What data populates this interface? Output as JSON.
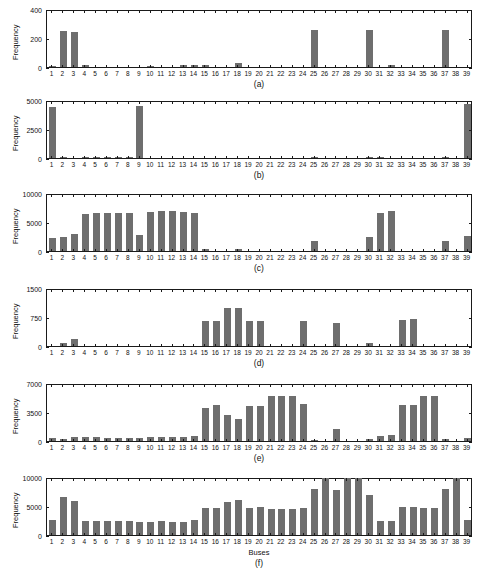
{
  "figure": {
    "background": "#ffffff",
    "bar_color": "#6e6e6e",
    "axis_color": "#1a1a1a",
    "xlabel": "Buses",
    "ylabel": "Frequency"
  },
  "chart_data": [
    {
      "type": "bar",
      "panel": "(a)",
      "title": "",
      "xlabel": "",
      "ylabel": "Frequency",
      "ylim": [
        0,
        400
      ],
      "yticks": [
        0,
        200,
        400
      ],
      "ytick_labels": [
        "0",
        "200",
        "400"
      ],
      "grid": false,
      "legend": "none",
      "categories": [
        "1",
        "2",
        "3",
        "4",
        "5",
        "6",
        "7",
        "8",
        "9",
        "10",
        "11",
        "12",
        "13",
        "14",
        "15",
        "16",
        "17",
        "18",
        "19",
        "20",
        "21",
        "22",
        "23",
        "24",
        "25",
        "26",
        "27",
        "28",
        "29",
        "30",
        "31",
        "32",
        "33",
        "34",
        "35",
        "36",
        "37",
        "38",
        "39"
      ],
      "values": [
        5,
        250,
        245,
        14,
        0,
        0,
        0,
        0,
        0,
        9,
        0,
        0,
        12,
        13,
        13,
        0,
        0,
        25,
        0,
        0,
        0,
        0,
        0,
        0,
        258,
        0,
        0,
        0,
        0,
        260,
        0,
        14,
        0,
        0,
        0,
        0,
        262,
        0,
        0
      ]
    },
    {
      "type": "bar",
      "panel": "(b)",
      "title": "",
      "xlabel": "",
      "ylabel": "Frequency",
      "ylim": [
        0,
        5000
      ],
      "yticks": [
        0,
        2500,
        5000
      ],
      "ytick_labels": [
        "0",
        "2500",
        "5000"
      ],
      "grid": false,
      "legend": "none",
      "categories": [
        "1",
        "2",
        "3",
        "4",
        "5",
        "6",
        "7",
        "8",
        "9",
        "10",
        "11",
        "12",
        "13",
        "14",
        "15",
        "16",
        "17",
        "18",
        "19",
        "20",
        "21",
        "22",
        "23",
        "24",
        "25",
        "26",
        "27",
        "28",
        "29",
        "30",
        "31",
        "32",
        "33",
        "34",
        "35",
        "36",
        "37",
        "38",
        "39"
      ],
      "values": [
        4500,
        60,
        0,
        40,
        50,
        40,
        30,
        40,
        4600,
        0,
        0,
        0,
        0,
        0,
        0,
        0,
        0,
        0,
        0,
        0,
        0,
        0,
        0,
        0,
        110,
        0,
        0,
        0,
        0,
        90,
        70,
        0,
        0,
        0,
        0,
        0,
        80,
        0,
        4700
      ]
    },
    {
      "type": "bar",
      "panel": "(c)",
      "title": "",
      "xlabel": "",
      "ylabel": "Frequency",
      "ylim": [
        0,
        10000
      ],
      "yticks": [
        0,
        5000,
        10000
      ],
      "ytick_labels": [
        "0",
        "5000",
        "10000"
      ],
      "grid": false,
      "legend": "none",
      "categories": [
        "1",
        "2",
        "3",
        "4",
        "5",
        "6",
        "7",
        "8",
        "9",
        "10",
        "11",
        "12",
        "13",
        "14",
        "15",
        "16",
        "17",
        "18",
        "19",
        "20",
        "21",
        "22",
        "23",
        "24",
        "25",
        "26",
        "27",
        "28",
        "29",
        "30",
        "31",
        "32",
        "33",
        "34",
        "35",
        "36",
        "37",
        "38",
        "39"
      ],
      "values": [
        2200,
        2400,
        2900,
        6550,
        6600,
        6600,
        6600,
        6600,
        2800,
        6900,
        6950,
        6950,
        6900,
        6600,
        300,
        0,
        0,
        400,
        0,
        0,
        0,
        0,
        0,
        0,
        1700,
        0,
        0,
        0,
        0,
        2500,
        6700,
        7000,
        0,
        0,
        0,
        0,
        1700,
        0,
        2700
      ]
    },
    {
      "type": "bar",
      "panel": "(d)",
      "title": "",
      "xlabel": "",
      "ylabel": "Frequency",
      "ylim": [
        0,
        1500
      ],
      "yticks": [
        0,
        750,
        1500
      ],
      "ytick_labels": [
        "0",
        "750",
        "1500"
      ],
      "grid": false,
      "legend": "none",
      "categories": [
        "1",
        "2",
        "3",
        "4",
        "5",
        "6",
        "7",
        "8",
        "9",
        "10",
        "11",
        "12",
        "13",
        "14",
        "15",
        "16",
        "17",
        "18",
        "19",
        "20",
        "21",
        "22",
        "23",
        "24",
        "25",
        "26",
        "27",
        "28",
        "29",
        "30",
        "31",
        "32",
        "33",
        "34",
        "35",
        "36",
        "37",
        "38",
        "39"
      ],
      "values": [
        0,
        80,
        175,
        0,
        0,
        0,
        0,
        0,
        0,
        0,
        0,
        0,
        0,
        0,
        670,
        670,
        1010,
        1010,
        665,
        665,
        0,
        0,
        0,
        665,
        0,
        0,
        600,
        0,
        0,
        90,
        0,
        0,
        695,
        700,
        0,
        0,
        0,
        0,
        0
      ]
    },
    {
      "type": "bar",
      "panel": "(e)",
      "title": "",
      "xlabel": "",
      "ylabel": "Frequency",
      "ylim": [
        0,
        7000
      ],
      "yticks": [
        0,
        3500,
        7000
      ],
      "ytick_labels": [
        "0",
        "3500",
        "7000"
      ],
      "grid": false,
      "legend": "none",
      "categories": [
        "1",
        "2",
        "3",
        "4",
        "5",
        "6",
        "7",
        "8",
        "9",
        "10",
        "11",
        "12",
        "13",
        "14",
        "15",
        "16",
        "17",
        "18",
        "19",
        "20",
        "21",
        "22",
        "23",
        "24",
        "25",
        "26",
        "27",
        "28",
        "29",
        "30",
        "31",
        "32",
        "33",
        "34",
        "35",
        "36",
        "37",
        "38",
        "39"
      ],
      "values": [
        330,
        200,
        480,
        520,
        450,
        430,
        380,
        330,
        330,
        520,
        520,
        470,
        450,
        600,
        4100,
        4400,
        3200,
        2700,
        4300,
        4300,
        5500,
        5500,
        5500,
        4500,
        180,
        0,
        1500,
        0,
        0,
        250,
        600,
        700,
        4400,
        4400,
        5500,
        5500,
        300,
        0,
        400
      ]
    },
    {
      "type": "bar",
      "panel": "(f)",
      "title": "",
      "xlabel": "Buses",
      "ylabel": "Frequency",
      "ylim": [
        0,
        10000
      ],
      "yticks": [
        0,
        5000,
        10000
      ],
      "ytick_labels": [
        "0",
        "5000",
        "10000"
      ],
      "grid": false,
      "legend": "none",
      "categories": [
        "1",
        "2",
        "3",
        "4",
        "5",
        "6",
        "7",
        "8",
        "9",
        "10",
        "11",
        "12",
        "13",
        "14",
        "15",
        "16",
        "17",
        "18",
        "19",
        "20",
        "21",
        "22",
        "23",
        "24",
        "25",
        "26",
        "27",
        "28",
        "29",
        "30",
        "31",
        "32",
        "33",
        "34",
        "35",
        "36",
        "37",
        "38",
        "39"
      ],
      "values": [
        2700,
        6700,
        6000,
        2400,
        2400,
        2400,
        2450,
        2500,
        2200,
        2350,
        2400,
        2300,
        2300,
        2550,
        4800,
        4800,
        5850,
        6200,
        4800,
        4850,
        4650,
        4650,
        4650,
        4800,
        8000,
        10000,
        7900,
        10000,
        10000,
        7000,
        2450,
        2500,
        4950,
        4950,
        4700,
        4700,
        8000,
        10000,
        2700
      ]
    }
  ]
}
